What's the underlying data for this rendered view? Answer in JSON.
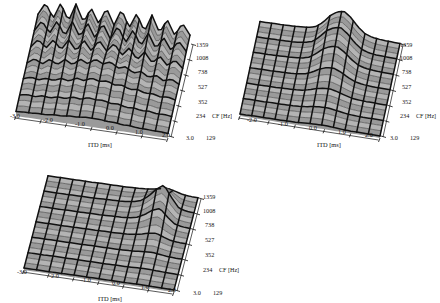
{
  "figure": {
    "kind": "three-panel-3d-surface-figure",
    "panel_count": 3,
    "background_color": "#ffffff",
    "surface_fill_color": "#9a9a9a",
    "surface_fill_color_light": "#b4b4b4",
    "mesh_line_color": "#111111",
    "axis_line_color": "#111111"
  },
  "axes": {
    "x": {
      "label": "ITD [ms]",
      "ticks": [
        "-3.0",
        "-2.0",
        "-1.0",
        "0.0",
        "1.0",
        "2.0",
        "3.0"
      ],
      "values": [
        -3.0,
        -2.0,
        -1.0,
        0.0,
        1.0,
        2.0,
        3.0
      ],
      "range": [
        -3.4,
        3.4
      ]
    },
    "y": {
      "label": "CF [Hz]",
      "ticks": [
        "1359",
        "1008",
        "738",
        "527",
        "352",
        "234",
        "129"
      ],
      "values": [
        1359,
        1008,
        738,
        527,
        352,
        234,
        129
      ],
      "order": "top-to-bottom"
    },
    "z": {
      "label": "",
      "ticks": []
    }
  },
  "panels": [
    {
      "id": "panel-1",
      "name": "panel-top-left",
      "x_ticks": [
        "-3.0",
        "-2.0",
        "-1.0",
        "0.0",
        "1.0",
        "2.0",
        "3.0"
      ],
      "y_ticks": [
        "1359",
        "1008",
        "738",
        "527",
        "352",
        "234",
        "129"
      ],
      "x_axis_title": "ITD [ms]",
      "y_axis_title": "CF [Hz]",
      "surface_description": "Strongly oscillating periodic ridges across ITD at all CF; amplitude and oscillation rate increase with CF"
    },
    {
      "id": "panel-2",
      "name": "panel-top-right",
      "x_ticks": [
        "-2.0",
        "-1.0",
        "0.0",
        "1.0",
        "2.0",
        "3.0"
      ],
      "y_ticks": [
        "1359",
        "1008",
        "738",
        "527",
        "352",
        "234",
        "129"
      ],
      "x_axis_title": "ITD [ms]",
      "y_axis_title": "CF [Hz]",
      "surface_description": "Nearly flat grid with a single central ridge peaking near ITD = 0.6 ms, largest at high CF"
    },
    {
      "id": "panel-3",
      "name": "panel-bottom-left",
      "x_ticks": [
        "-3.0",
        "-2.0",
        "-1.0",
        "0.0",
        "1.0",
        "2.0",
        "3.0"
      ],
      "y_ticks": [
        "1359",
        "1008",
        "738",
        "527",
        "352",
        "234",
        "129"
      ],
      "x_axis_title": "ITD [ms]",
      "y_axis_title": "CF [Hz]",
      "surface_description": "Flat grid with one narrow localized peak near ITD = 2.0 ms at mid CF"
    }
  ],
  "chart_data": {
    "type": "line",
    "title": "",
    "xlabel": "ITD [ms]",
    "ylabel": "CF [Hz]",
    "grid": true,
    "legend_position": "none",
    "x": [
      -3.0,
      -2.7,
      -2.4,
      -2.1,
      -1.8,
      -1.5,
      -1.2,
      -0.9,
      -0.6,
      -0.3,
      0.0,
      0.3,
      0.6,
      0.9,
      1.2,
      1.5,
      1.8,
      2.1,
      2.4,
      2.7,
      3.0
    ],
    "categories": [
      "1359",
      "1008",
      "738",
      "527",
      "352",
      "234",
      "129"
    ],
    "panel_1": {
      "note": "oscillatory cross-correlation; z normalized 0-1 per CF row",
      "series": [
        {
          "name": "CF 1359",
          "values": [
            0.3,
            0.78,
            0.22,
            0.86,
            0.2,
            0.9,
            0.24,
            0.84,
            0.26,
            0.92,
            0.3,
            0.95,
            0.28,
            0.88,
            0.22,
            0.9,
            0.26,
            0.82,
            0.24,
            0.76,
            0.34
          ]
        },
        {
          "name": "CF 1008",
          "values": [
            0.26,
            0.68,
            0.24,
            0.76,
            0.22,
            0.82,
            0.26,
            0.86,
            0.3,
            0.92,
            0.36,
            0.9,
            0.3,
            0.84,
            0.26,
            0.8,
            0.24,
            0.72,
            0.26,
            0.66,
            0.3
          ]
        },
        {
          "name": "CF 738",
          "values": [
            0.22,
            0.55,
            0.26,
            0.62,
            0.28,
            0.7,
            0.32,
            0.78,
            0.4,
            0.86,
            0.48,
            0.82,
            0.4,
            0.74,
            0.32,
            0.66,
            0.28,
            0.58,
            0.26,
            0.52,
            0.24
          ]
        },
        {
          "name": "CF 527",
          "values": [
            0.2,
            0.4,
            0.24,
            0.46,
            0.3,
            0.54,
            0.38,
            0.64,
            0.5,
            0.72,
            0.58,
            0.7,
            0.5,
            0.6,
            0.4,
            0.5,
            0.32,
            0.44,
            0.26,
            0.38,
            0.22
          ]
        },
        {
          "name": "CF 352",
          "values": [
            0.18,
            0.28,
            0.22,
            0.32,
            0.28,
            0.4,
            0.34,
            0.5,
            0.44,
            0.58,
            0.5,
            0.56,
            0.44,
            0.48,
            0.36,
            0.4,
            0.3,
            0.32,
            0.24,
            0.28,
            0.2
          ]
        },
        {
          "name": "CF 234",
          "values": [
            0.14,
            0.2,
            0.16,
            0.24,
            0.2,
            0.28,
            0.26,
            0.36,
            0.32,
            0.42,
            0.38,
            0.4,
            0.32,
            0.34,
            0.26,
            0.28,
            0.22,
            0.24,
            0.18,
            0.2,
            0.16
          ]
        },
        {
          "name": "CF 129",
          "values": [
            0.1,
            0.12,
            0.12,
            0.14,
            0.14,
            0.18,
            0.18,
            0.22,
            0.22,
            0.26,
            0.26,
            0.26,
            0.22,
            0.22,
            0.18,
            0.18,
            0.14,
            0.14,
            0.12,
            0.12,
            0.1
          ]
        }
      ]
    },
    "panel_2": {
      "note": "single central ridge near ITD 0.6 ms",
      "series": [
        {
          "name": "CF 1359",
          "values": [
            0.02,
            0.02,
            0.03,
            0.03,
            0.04,
            0.05,
            0.07,
            0.1,
            0.18,
            0.4,
            0.72,
            0.92,
            1.0,
            0.78,
            0.44,
            0.2,
            0.1,
            0.06,
            0.04,
            0.03,
            0.02
          ]
        },
        {
          "name": "CF 1008",
          "values": [
            0.02,
            0.02,
            0.03,
            0.03,
            0.04,
            0.05,
            0.07,
            0.11,
            0.2,
            0.44,
            0.74,
            0.9,
            0.96,
            0.74,
            0.42,
            0.19,
            0.09,
            0.05,
            0.04,
            0.03,
            0.02
          ]
        },
        {
          "name": "CF 738",
          "values": [
            0.02,
            0.02,
            0.02,
            0.03,
            0.04,
            0.05,
            0.07,
            0.1,
            0.18,
            0.38,
            0.62,
            0.76,
            0.8,
            0.62,
            0.36,
            0.17,
            0.08,
            0.05,
            0.03,
            0.02,
            0.02
          ]
        },
        {
          "name": "CF 527",
          "values": [
            0.01,
            0.02,
            0.02,
            0.02,
            0.03,
            0.04,
            0.05,
            0.08,
            0.13,
            0.26,
            0.42,
            0.52,
            0.54,
            0.42,
            0.25,
            0.12,
            0.06,
            0.03,
            0.02,
            0.02,
            0.01
          ]
        },
        {
          "name": "CF 352",
          "values": [
            0.01,
            0.01,
            0.01,
            0.02,
            0.02,
            0.03,
            0.04,
            0.05,
            0.08,
            0.15,
            0.24,
            0.3,
            0.31,
            0.24,
            0.15,
            0.07,
            0.04,
            0.02,
            0.02,
            0.01,
            0.01
          ]
        },
        {
          "name": "CF 234",
          "values": [
            0.01,
            0.01,
            0.01,
            0.01,
            0.02,
            0.02,
            0.02,
            0.03,
            0.05,
            0.08,
            0.13,
            0.16,
            0.17,
            0.13,
            0.08,
            0.04,
            0.02,
            0.01,
            0.01,
            0.01,
            0.01
          ]
        },
        {
          "name": "CF 129",
          "values": [
            0.0,
            0.0,
            0.01,
            0.01,
            0.01,
            0.01,
            0.01,
            0.02,
            0.02,
            0.04,
            0.06,
            0.07,
            0.08,
            0.06,
            0.04,
            0.02,
            0.01,
            0.01,
            0.01,
            0.0,
            0.0
          ]
        }
      ]
    },
    "panel_3": {
      "note": "flat surface with one narrow peak near ITD 2.0 ms",
      "series": [
        {
          "name": "CF 1359",
          "values": [
            0.01,
            0.01,
            0.01,
            0.01,
            0.01,
            0.01,
            0.01,
            0.02,
            0.02,
            0.02,
            0.02,
            0.03,
            0.04,
            0.06,
            0.1,
            0.16,
            0.22,
            0.14,
            0.05,
            0.02,
            0.01
          ]
        },
        {
          "name": "CF 1008",
          "values": [
            0.01,
            0.01,
            0.01,
            0.01,
            0.02,
            0.02,
            0.02,
            0.03,
            0.04,
            0.05,
            0.06,
            0.08,
            0.12,
            0.22,
            0.46,
            0.78,
            1.0,
            0.52,
            0.12,
            0.04,
            0.02
          ]
        },
        {
          "name": "CF 738",
          "values": [
            0.01,
            0.01,
            0.01,
            0.01,
            0.02,
            0.02,
            0.02,
            0.03,
            0.03,
            0.04,
            0.05,
            0.06,
            0.09,
            0.16,
            0.32,
            0.54,
            0.66,
            0.34,
            0.09,
            0.03,
            0.01
          ]
        },
        {
          "name": "CF 527",
          "values": [
            0.01,
            0.01,
            0.01,
            0.01,
            0.01,
            0.01,
            0.02,
            0.02,
            0.02,
            0.03,
            0.03,
            0.04,
            0.05,
            0.08,
            0.14,
            0.22,
            0.27,
            0.15,
            0.05,
            0.02,
            0.01
          ]
        },
        {
          "name": "CF 352",
          "values": [
            0.0,
            0.01,
            0.01,
            0.01,
            0.01,
            0.01,
            0.01,
            0.01,
            0.02,
            0.02,
            0.02,
            0.02,
            0.03,
            0.04,
            0.06,
            0.09,
            0.11,
            0.07,
            0.03,
            0.01,
            0.01
          ]
        },
        {
          "name": "CF 234",
          "values": [
            0.0,
            0.0,
            0.0,
            0.01,
            0.01,
            0.01,
            0.01,
            0.01,
            0.01,
            0.01,
            0.01,
            0.01,
            0.02,
            0.02,
            0.03,
            0.04,
            0.05,
            0.03,
            0.02,
            0.01,
            0.0
          ]
        },
        {
          "name": "CF 129",
          "values": [
            0.0,
            0.0,
            0.0,
            0.0,
            0.0,
            0.0,
            0.01,
            0.01,
            0.01,
            0.01,
            0.01,
            0.01,
            0.01,
            0.01,
            0.01,
            0.02,
            0.02,
            0.01,
            0.01,
            0.0,
            0.0
          ]
        }
      ]
    }
  }
}
